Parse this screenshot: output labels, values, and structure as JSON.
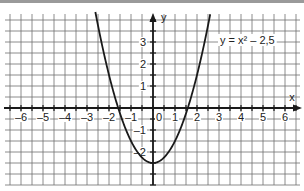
{
  "chart_data": {
    "type": "line",
    "title": "",
    "annotation": "y = x² – 2,5",
    "xlabel": "x",
    "ylabel": "y",
    "xlim": [
      -6.5,
      6.5
    ],
    "ylim": [
      -3.5,
      4
    ],
    "grid": true,
    "grid_step": 0.5,
    "x_ticks": [
      -6,
      -5,
      -4,
      -3,
      -2,
      -1,
      0,
      1,
      2,
      3,
      4,
      5,
      6
    ],
    "y_ticks": [
      -2,
      -1,
      1,
      2,
      3
    ],
    "series": [
      {
        "name": "y = x² – 2,5",
        "function": "x^2 - 2.5",
        "x": [
          -2.6,
          -2.5,
          -2,
          -1.5,
          -1,
          -0.5,
          0,
          0.5,
          1,
          1.5,
          2,
          2.5,
          2.6
        ],
        "values": [
          4.26,
          3.75,
          1.5,
          -0.25,
          -1.5,
          -2.25,
          -2.5,
          -2.25,
          -1.5,
          -0.25,
          1.5,
          3.75,
          4.26
        ]
      }
    ]
  },
  "labels": {
    "x_axis": "x",
    "y_axis": "y",
    "equation": "y = x² – 2,5",
    "x_ticks": [
      "–6",
      "–5",
      "–4",
      "–3",
      "–2",
      "–1",
      "0",
      "1",
      "2",
      "3",
      "4",
      "5",
      "6"
    ],
    "y_ticks_pos": [
      "3",
      "2",
      "1"
    ],
    "y_ticks_neg": [
      "–1",
      "–2"
    ]
  },
  "colors": {
    "grid": "#6f6f6f",
    "axis": "#1a1a1a",
    "curve": "#1a1a1a",
    "topbar": "#9a9a9a"
  }
}
